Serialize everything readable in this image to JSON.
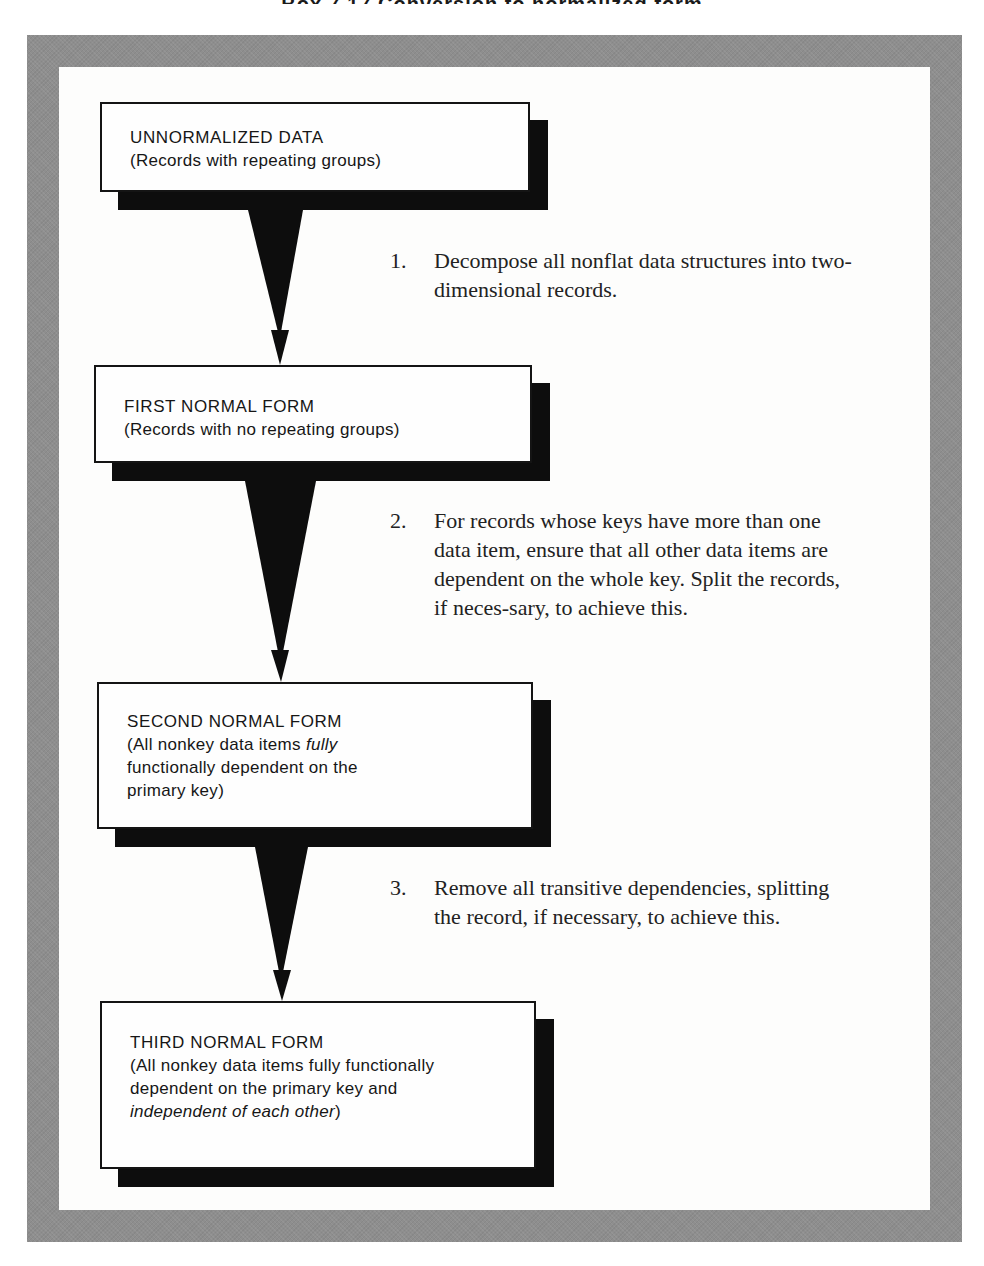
{
  "figure": {
    "title_fragment": "Box 7.17  Conversion to normalized form",
    "colors": {
      "frame": "#8e8e8e",
      "panel": "#fdfdfc",
      "box_border": "#141414",
      "box_shadow": "#0d0d0d",
      "arrow": "#0d0d0d"
    }
  },
  "boxes": [
    {
      "heading": "UNNORMALIZED DATA",
      "desc_parts": [
        {
          "text": "(Records with repeating groups)",
          "italic": false
        }
      ]
    },
    {
      "heading": "FIRST NORMAL FORM",
      "desc_parts": [
        {
          "text": "(Records with no repeating groups)",
          "italic": false
        }
      ]
    },
    {
      "heading": "SECOND NORMAL FORM",
      "desc_parts": [
        {
          "text": "(All nonkey data items ",
          "italic": false
        },
        {
          "text": "fully",
          "italic": true
        },
        {
          "text": " functionally dependent on the primary key)",
          "italic": false
        }
      ]
    },
    {
      "heading": "THIRD NORMAL FORM",
      "desc_parts": [
        {
          "text": "(All nonkey data items fully functionally dependent on the primary key and ",
          "italic": false
        },
        {
          "text": "independent of each other",
          "italic": true
        },
        {
          "text": ")",
          "italic": false
        }
      ]
    }
  ],
  "steps": [
    {
      "number": "1.",
      "text": "Decompose all nonflat data structures into two-dimensional records."
    },
    {
      "number": "2.",
      "text": "For records whose keys have more than one data item, ensure that all other data items are dependent on the whole key. Split the records, if neces-sary, to achieve this."
    },
    {
      "number": "3.",
      "text": "Remove all transitive dependencies, splitting the record, if necessary, to achieve this."
    }
  ]
}
